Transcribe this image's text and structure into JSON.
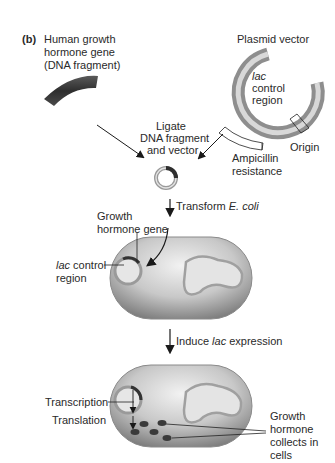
{
  "panel_label": "(b)",
  "step1": {
    "gene_label_line1": "Human growth",
    "gene_label_line2": "hormone gene",
    "gene_label_line3": "(DNA fragment)",
    "plasmid_title": "Plasmid vector",
    "plasmid_lac_line1": "lac",
    "plasmid_lac_line2": "control",
    "plasmid_lac_line3": "region",
    "ampicillin_line1": "Ampicillin",
    "ampicillin_line2": "resistance",
    "origin_label": "Origin"
  },
  "step2": {
    "ligate_line1": "Ligate",
    "ligate_line2": "DNA fragment",
    "ligate_line3": "and vector",
    "transform_prefix": "Transform ",
    "transform_organism": "E. coli"
  },
  "step3": {
    "growth_gene_line1": "Growth",
    "growth_gene_line2": "hormone gene",
    "lac_line1_italic": "lac",
    "lac_line1_rest": " control",
    "lac_line2": "region",
    "induce_prefix": "Induce ",
    "induce_italic": "lac",
    "induce_suffix": " expression"
  },
  "step4": {
    "transcription": "Transcription",
    "translation": "Translation",
    "collects_line1": "Growth",
    "collects_line2": "hormone",
    "collects_line3": "collects in",
    "collects_line4": "cells"
  },
  "colors": {
    "gene_dark": "#3a3a3a",
    "plasmid_gray": "#9a9a9a",
    "cell_gray": "#b5b5b5",
    "arrow": "#1a1a1a"
  }
}
